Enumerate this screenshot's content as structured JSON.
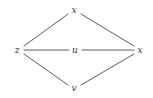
{
  "diagram": {
    "type": "graph",
    "background_color": "#ffffff",
    "edge_color": "#4a4a4a",
    "label_color": "#3a3a3a",
    "nodes": [
      {
        "id": "z",
        "label": "z",
        "x": 17,
        "y": 50
      },
      {
        "id": "x_top",
        "label": "x",
        "x": 74,
        "y": 10
      },
      {
        "id": "u",
        "label": "u",
        "x": 75,
        "y": 50
      },
      {
        "id": "v",
        "label": "v",
        "x": 74,
        "y": 88
      },
      {
        "id": "x_right",
        "label": "x",
        "x": 140,
        "y": 50
      }
    ],
    "edges": [
      {
        "from": "z",
        "to": "x_top",
        "x1": 24,
        "y1": 46,
        "x2": 68,
        "y2": 14
      },
      {
        "from": "z",
        "to": "u",
        "x1": 24,
        "y1": 50,
        "x2": 69,
        "y2": 50
      },
      {
        "from": "z",
        "to": "v",
        "x1": 24,
        "y1": 54,
        "x2": 68,
        "y2": 85
      },
      {
        "from": "x_top",
        "to": "x_right",
        "x1": 81,
        "y1": 14,
        "x2": 134,
        "y2": 46
      },
      {
        "from": "u",
        "to": "x_right",
        "x1": 82,
        "y1": 50,
        "x2": 134,
        "y2": 50
      },
      {
        "from": "v",
        "to": "x_right",
        "x1": 81,
        "y1": 85,
        "x2": 134,
        "y2": 54
      }
    ]
  }
}
